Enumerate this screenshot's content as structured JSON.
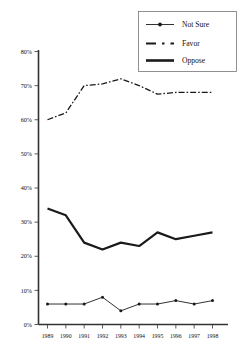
{
  "chart_data": {
    "type": "line",
    "title": "",
    "subtitle": "",
    "xlabel": "",
    "ylabel": "",
    "categories": [
      "1989",
      "1990",
      "1991",
      "1992",
      "1993",
      "1994",
      "1995",
      "1996",
      "1997",
      "1998"
    ],
    "x": [
      1989,
      1990,
      1991,
      1992,
      1993,
      1994,
      1995,
      1996,
      1997,
      1998
    ],
    "ylim": [
      0,
      80
    ],
    "ytick_values": [
      0,
      10,
      20,
      30,
      40,
      50,
      60,
      70,
      80
    ],
    "ytick_labels": [
      "0%",
      "10%",
      "20%",
      "30%",
      "40%",
      "50%",
      "60%",
      "70%",
      "80%"
    ],
    "xtick_labels": [
      "1989",
      "1990",
      "1991",
      "1992",
      "1993",
      "1994",
      "1995",
      "1996",
      "1997",
      "1998"
    ],
    "grid": false,
    "legend_position": "top-right",
    "series": [
      {
        "name": "Not Sure",
        "style": "thin-solid-with-markers",
        "color": "#1a1a1a",
        "values": [
          6,
          6,
          6,
          8,
          4,
          6,
          6,
          7,
          6,
          7
        ]
      },
      {
        "name": "Favor",
        "style": "dash-dot",
        "color": "#1a1a1a",
        "values": [
          60,
          62,
          70,
          70.5,
          72,
          70,
          67.5,
          68,
          68,
          68
        ]
      },
      {
        "name": "Oppose",
        "style": "thick-solid",
        "color": "#1a1a1a",
        "values": [
          34,
          32,
          24,
          22,
          24,
          23,
          27,
          25,
          26,
          27
        ]
      }
    ],
    "annotations": []
  },
  "legend": {
    "entries": [
      {
        "label": "Not Sure",
        "swatch": "line-with-dot-marker-icon"
      },
      {
        "label": "Favor",
        "swatch": "dash-dot-line-icon"
      },
      {
        "label": "Oppose",
        "swatch": "thick-line-icon"
      }
    ]
  }
}
